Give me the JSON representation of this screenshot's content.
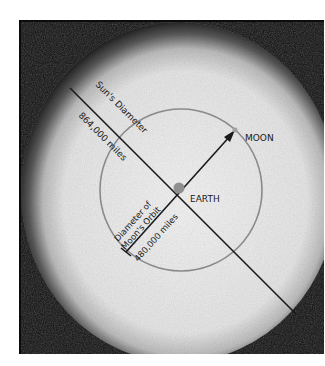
{
  "diagram": {
    "labels": {
      "sun_diameter": "Sun's Diameter",
      "sun_diameter_value": "864,000 miles",
      "moon_orbit_line1": "Diameter of",
      "moon_orbit_line2": "Moon's Orbit",
      "moon_orbit_value": "480,000 miles",
      "earth": "EARTH",
      "moon": "MOON"
    },
    "colors": {
      "background": "#ffffff",
      "space": "#0c0c0c",
      "sun": "#ececec",
      "orbit": "#8a8a8a",
      "line": "#1a1a1a",
      "earth_dot": "#8f8f8f",
      "moon_dot": "#a0a0a0"
    }
  }
}
